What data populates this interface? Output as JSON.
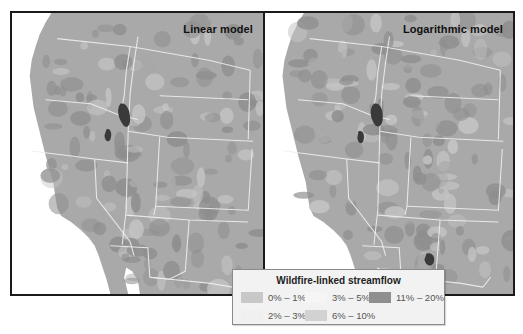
{
  "figure": {
    "panels": [
      {
        "id": "linear",
        "title": "Linear model"
      },
      {
        "id": "log",
        "title": "Logarithmic model"
      }
    ],
    "legend": {
      "title": "Wildfire-linked streamflow",
      "items": [
        {
          "label": "0% – 1%",
          "color": "#c8c8c8"
        },
        {
          "label": "2% – 3%",
          "color": "#f0f0f0"
        },
        {
          "label": "3% – 5%",
          "color": "#f5f5f5"
        },
        {
          "label": "6% – 10%",
          "color": "#d2d2d2"
        },
        {
          "label": "11% – 20%",
          "color": "#8f8f8f"
        }
      ]
    },
    "colors": {
      "ocean": "#ffffff",
      "land": "#a9a9a9",
      "land_dark": "#8e8e8e",
      "land_light": "#c4c4c4",
      "border": "#eeeeee",
      "hotspot": "#3a3a3a"
    }
  }
}
